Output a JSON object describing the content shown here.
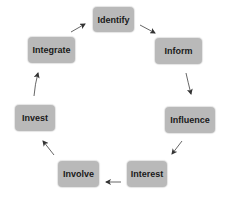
{
  "diagram": {
    "type": "cycle",
    "nodes": [
      {
        "id": "identify",
        "label": "Identify",
        "x": 93,
        "y": 7,
        "w": 41,
        "h": 25
      },
      {
        "id": "inform",
        "label": "Inform",
        "x": 155,
        "y": 38,
        "w": 47,
        "h": 26
      },
      {
        "id": "influence",
        "label": "Influence",
        "x": 165,
        "y": 107,
        "w": 50,
        "h": 26
      },
      {
        "id": "interest",
        "label": "Interest",
        "x": 127,
        "y": 161,
        "w": 40,
        "h": 26
      },
      {
        "id": "involve",
        "label": "Involve",
        "x": 58,
        "y": 161,
        "w": 41,
        "h": 26
      },
      {
        "id": "invest",
        "label": "Invest",
        "x": 15,
        "y": 105,
        "w": 40,
        "h": 26
      },
      {
        "id": "integrate",
        "label": "Integrate",
        "x": 28,
        "y": 37,
        "w": 47,
        "h": 26
      }
    ],
    "edges": [
      {
        "from": "identify",
        "to": "inform"
      },
      {
        "from": "inform",
        "to": "influence"
      },
      {
        "from": "influence",
        "to": "interest"
      },
      {
        "from": "interest",
        "to": "involve"
      },
      {
        "from": "involve",
        "to": "invest"
      },
      {
        "from": "invest",
        "to": "integrate"
      },
      {
        "from": "integrate",
        "to": "identify"
      }
    ],
    "colors": {
      "node_fill": "#b9b9b9",
      "text": "#1a1a1a",
      "arrow": "#333333"
    }
  }
}
